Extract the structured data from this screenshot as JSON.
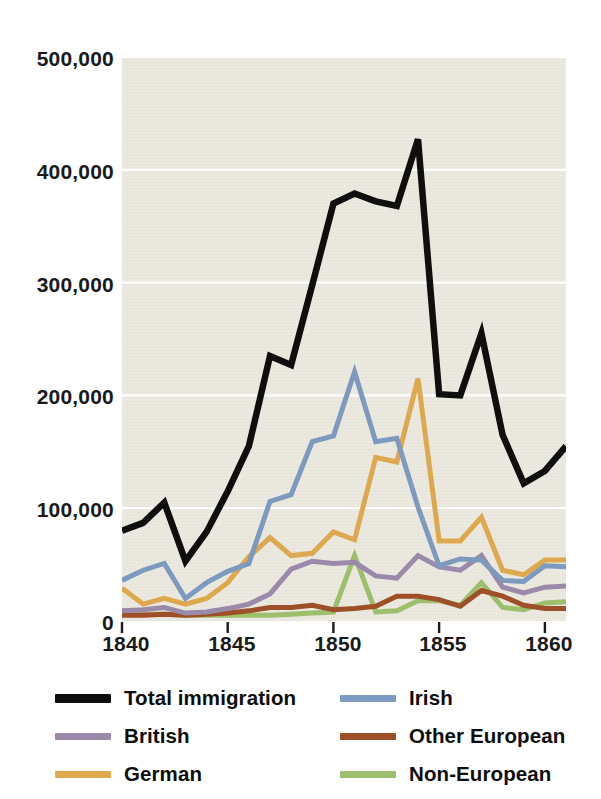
{
  "chart_data": {
    "type": "line",
    "title": "",
    "subtitle": "",
    "xlabel": "",
    "ylabel": "",
    "xlim": [
      1840,
      1861
    ],
    "ylim": [
      0,
      500000
    ],
    "grid": "horizontal",
    "legend_position": "bottom",
    "x_tick_labels": [
      "1840",
      "1845",
      "1850",
      "1855",
      "1860"
    ],
    "x_ticks": [
      1840,
      1845,
      1850,
      1855,
      1860
    ],
    "y_tick_labels": [
      "0",
      "100,000",
      "200,000",
      "300,000",
      "400,000",
      "500,000"
    ],
    "y_ticks": [
      0,
      100000,
      200000,
      300000,
      400000,
      500000
    ],
    "x": [
      1840,
      1841,
      1842,
      1843,
      1844,
      1845,
      1846,
      1847,
      1848,
      1849,
      1850,
      1851,
      1852,
      1853,
      1854,
      1855,
      1856,
      1857,
      1858,
      1859,
      1860,
      1861
    ],
    "series": [
      {
        "name": "Total immigration",
        "color": "#0d0d0d",
        "width": 6.5,
        "values": [
          80000,
          87000,
          105000,
          53000,
          79000,
          115000,
          155000,
          235000,
          227000,
          298000,
          370000,
          379000,
          372000,
          368000,
          427000,
          201000,
          200000,
          255000,
          165000,
          122000,
          133000,
          155000
        ]
      },
      {
        "name": "Irish",
        "color": "#7d9ac0",
        "width": 5,
        "values": [
          36000,
          45000,
          51000,
          20000,
          34000,
          44000,
          51000,
          106000,
          112000,
          159000,
          164000,
          221000,
          159000,
          162000,
          101000,
          49000,
          55000,
          54000,
          36000,
          35000,
          49000,
          48000
        ]
      },
      {
        "name": "British",
        "color": "#9b8aab",
        "width": 5,
        "values": [
          9000,
          10000,
          12000,
          7000,
          8000,
          11000,
          15000,
          24000,
          46000,
          53000,
          51000,
          52000,
          40000,
          38000,
          58000,
          48000,
          45000,
          58000,
          30000,
          25000,
          30000,
          31000
        ]
      },
      {
        "name": "German",
        "color": "#dfa94e",
        "width": 5,
        "values": [
          29000,
          15000,
          20000,
          15000,
          20000,
          34000,
          57000,
          74000,
          58000,
          60000,
          79000,
          72000,
          145000,
          141000,
          215000,
          71000,
          71000,
          92000,
          45000,
          41000,
          54000,
          54000
        ]
      },
      {
        "name": "Other European",
        "color": "#9e4f28",
        "width": 5,
        "values": [
          5000,
          5000,
          6000,
          5000,
          6000,
          7000,
          9000,
          12000,
          12000,
          14000,
          10000,
          11000,
          13000,
          22000,
          22000,
          19000,
          13000,
          27000,
          22000,
          14000,
          11000,
          11000
        ]
      },
      {
        "name": "Non-European",
        "color": "#9ec06c",
        "width": 5,
        "values": [
          6000,
          6000,
          6000,
          5000,
          5000,
          5000,
          5000,
          5000,
          6000,
          7000,
          8000,
          58000,
          8000,
          9000,
          18000,
          18000,
          14000,
          34000,
          12000,
          10000,
          16000,
          17000
        ]
      }
    ],
    "legend": [
      {
        "label": "Total immigration",
        "color": "#0d0d0d",
        "column": 0,
        "row": 0,
        "thick": true
      },
      {
        "label": "Irish",
        "color": "#7d9ac0",
        "column": 1,
        "row": 0,
        "thick": false
      },
      {
        "label": "British",
        "color": "#9b8aab",
        "column": 0,
        "row": 1,
        "thick": false
      },
      {
        "label": "Other European",
        "color": "#9e4f28",
        "column": 1,
        "row": 1,
        "thick": false
      },
      {
        "label": "German",
        "color": "#dfa94e",
        "column": 0,
        "row": 2,
        "thick": false
      },
      {
        "label": "Non-European",
        "color": "#9ec06c",
        "column": 1,
        "row": 2,
        "thick": false
      }
    ],
    "colors": {
      "plot_background": "#eceae0",
      "page_background": "#ffffff",
      "gridline": "#ffffff",
      "tick_mark": "#1a1a1a",
      "axis_text": "#1a1a1a"
    }
  }
}
